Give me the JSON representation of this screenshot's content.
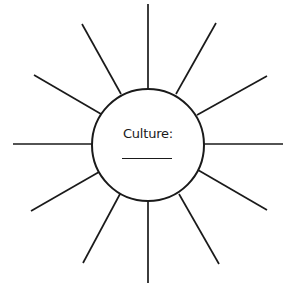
{
  "diagram": {
    "type": "sun-web-organizer",
    "center": {
      "label": "Culture:",
      "blank_line": true
    },
    "ray_count": 12,
    "colors": {
      "stroke": "#1a1a1a",
      "background": "#ffffff"
    }
  }
}
